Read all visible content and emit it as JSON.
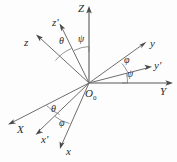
{
  "figure": {
    "background_color": "#fdfdfd",
    "line_color": "#6e6e6e",
    "text_color": "#2b2b2b",
    "width": 177,
    "height": 162
  },
  "origin": {
    "label": "O",
    "subscript": "0",
    "x": 89,
    "y": 83
  },
  "axes": [
    {
      "name": "Z",
      "label": "Z",
      "frame": "fixed",
      "label_x": 78,
      "label_y": 5,
      "from": [
        89,
        83
      ],
      "to": [
        89,
        10
      ]
    },
    {
      "name": "Y",
      "label": "Y",
      "frame": "fixed",
      "label_x": 160,
      "label_y": 87,
      "from": [
        89,
        83
      ],
      "to": [
        171,
        83
      ]
    },
    {
      "name": "X",
      "label": "X",
      "frame": "fixed",
      "label_x": 16,
      "label_y": 125,
      "from": [
        89,
        83
      ],
      "to": [
        9,
        124
      ]
    },
    {
      "name": "z",
      "label": "z",
      "frame": "rotated",
      "label_x": 24,
      "label_y": 38,
      "from": [
        89,
        83
      ],
      "to": [
        37,
        35
      ]
    },
    {
      "name": "y",
      "label": "y",
      "frame": "rotated",
      "label_x": 150,
      "label_y": 40,
      "from": [
        89,
        83
      ],
      "to": [
        145,
        42
      ]
    },
    {
      "name": "x",
      "label": "x",
      "frame": "rotated",
      "label_x": 66,
      "label_y": 148,
      "from": [
        89,
        83
      ],
      "to": [
        61,
        148
      ]
    },
    {
      "name": "z-prime",
      "label": "z'",
      "frame": "intermediate",
      "label_x": 52,
      "label_y": 19,
      "from": [
        89,
        83
      ],
      "to": [
        59,
        25
      ]
    },
    {
      "name": "y-prime",
      "label": "y'",
      "frame": "intermediate",
      "label_x": 154,
      "label_y": 62,
      "from": [
        89,
        83
      ],
      "to": [
        150,
        67
      ]
    },
    {
      "name": "x-prime",
      "label": "x'",
      "frame": "intermediate",
      "label_x": 41,
      "label_y": 137,
      "from": [
        89,
        83
      ],
      "to": [
        36,
        134
      ]
    }
  ],
  "angles": [
    {
      "name": "theta-upper",
      "label": "θ",
      "between": [
        "z",
        "z'"
      ],
      "label_x": 60,
      "label_y": 40
    },
    {
      "name": "psi-upper",
      "label": "ψ",
      "between": [
        "z'",
        "Z"
      ],
      "label_x": 78,
      "label_y": 37
    },
    {
      "name": "phi-right",
      "label": "φ",
      "between": [
        "y",
        "y'"
      ],
      "label_x": 124,
      "label_y": 58
    },
    {
      "name": "psi-right",
      "label": "ψ",
      "between": [
        "y'",
        "Y"
      ],
      "label_x": 127,
      "label_y": 72
    },
    {
      "name": "theta-lower",
      "label": "θ",
      "between": [
        "X",
        "x'"
      ],
      "label_x": 52,
      "label_y": 108
    },
    {
      "name": "phi-lower",
      "label": "φ",
      "between": [
        "x'",
        "x"
      ],
      "label_x": 60,
      "label_y": 122
    }
  ]
}
